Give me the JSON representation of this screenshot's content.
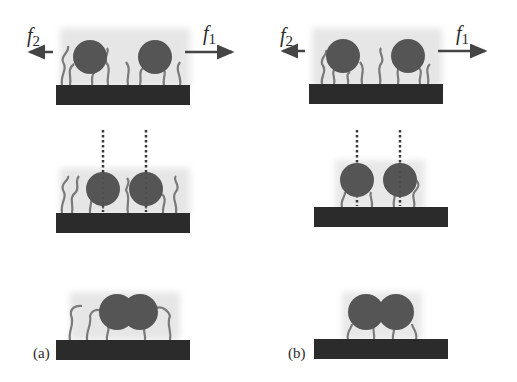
{
  "figure": {
    "colors": {
      "substrate": "#2b2b2b",
      "particle": "#555555",
      "halo": "#e4e4e4",
      "chain": "#7a7a7a",
      "tether": "#3a3a3a",
      "arrow": "#444444",
      "text": "#2a2a2a"
    },
    "panels": [
      {
        "id": "a",
        "label": "(a)",
        "force_left": {
          "symbol": "f",
          "subscript": "2"
        },
        "force_right": {
          "symbol": "f",
          "subscript": "1"
        }
      },
      {
        "id": "b",
        "label": "(b)",
        "force_left": {
          "symbol": "f",
          "subscript": "2"
        },
        "force_right": {
          "symbol": "f",
          "subscript": "1"
        }
      }
    ]
  }
}
